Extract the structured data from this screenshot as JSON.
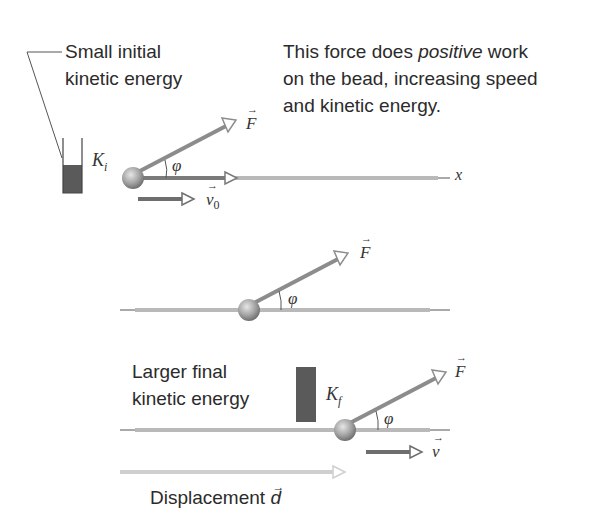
{
  "figure": {
    "top_panel": {
      "caption_left": [
        "Small initial",
        "kinetic energy"
      ],
      "caption_right": {
        "line1_pre": "This force does ",
        "line1_em": "positive",
        "line1_post": " work",
        "line2": "on the bead, increasing speed",
        "line3": "and kinetic energy."
      },
      "energy_label": "K",
      "energy_sub": "i",
      "force_label": "F",
      "angle_label": "φ",
      "velocity_label": "v",
      "velocity_sub": "0",
      "axis_label": "x"
    },
    "middle_panel": {
      "force_label": "F",
      "angle_label": "φ"
    },
    "bottom_panel": {
      "caption_left": [
        "Larger final",
        "kinetic energy"
      ],
      "energy_label": "K",
      "energy_sub": "f",
      "force_label": "F",
      "angle_label": "φ",
      "velocity_label": "v",
      "displacement_label": "Displacement",
      "displacement_symbol": "d"
    },
    "colors": {
      "wire": "#b9b9b9",
      "force_arrow": "#8c8c8c",
      "velocity_arrow": "#6e6e6e",
      "energy_bar": "#5a5a5a",
      "bead": "#a8a8a8",
      "displacement_arrow": "#cfcfcf"
    },
    "ki_level_pct": 50,
    "kf_level_pct": 100
  }
}
